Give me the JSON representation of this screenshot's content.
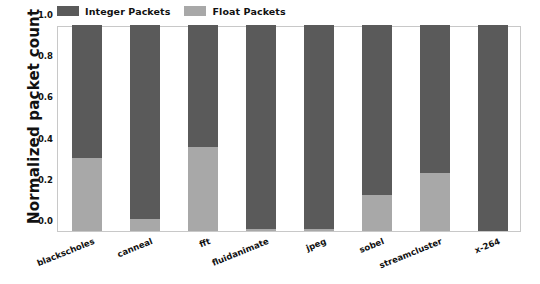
{
  "chart_data": {
    "type": "bar",
    "subtype": "stacked-bar-normalized",
    "title": "",
    "xlabel": "",
    "ylabel": "Normalized packet count",
    "ylim": [
      0.0,
      1.0
    ],
    "yticks": [
      "0.0",
      "0.2",
      "0.4",
      "0.6",
      "0.8",
      "1.0"
    ],
    "ytick_values": [
      0.0,
      0.2,
      0.4,
      0.6,
      0.8,
      1.0
    ],
    "grid": false,
    "legend_position": "above-axes-left",
    "categories": [
      "blackscholes",
      "canneal",
      "fft",
      "fluidanimate",
      "jpeg",
      "sobel",
      "streamcluster",
      "x-264"
    ],
    "series": [
      {
        "name": "Float Packets",
        "color": "#a8a8a8",
        "values": [
          0.355,
          0.06,
          0.41,
          0.012,
          0.01,
          0.175,
          0.28,
          0.0
        ]
      },
      {
        "name": "Integer Packets",
        "color": "#5a5a5a",
        "values": [
          0.645,
          0.94,
          0.59,
          0.988,
          0.99,
          0.825,
          0.72,
          1.0
        ]
      }
    ],
    "stack_order_bottom_to_top": [
      "Float Packets",
      "Integer Packets"
    ],
    "annotations": []
  },
  "legend": {
    "entries": [
      {
        "label": "Integer Packets",
        "color": "#5a5a5a"
      },
      {
        "label": "Float Packets",
        "color": "#a8a8a8"
      }
    ]
  },
  "axes": {
    "y_title": "Normalized packet count"
  },
  "colors": {
    "integer_packets": "#5a5a5a",
    "float_packets": "#a8a8a8",
    "frame": "#c8c8c8",
    "text": "#111111",
    "background": "#ffffff"
  }
}
